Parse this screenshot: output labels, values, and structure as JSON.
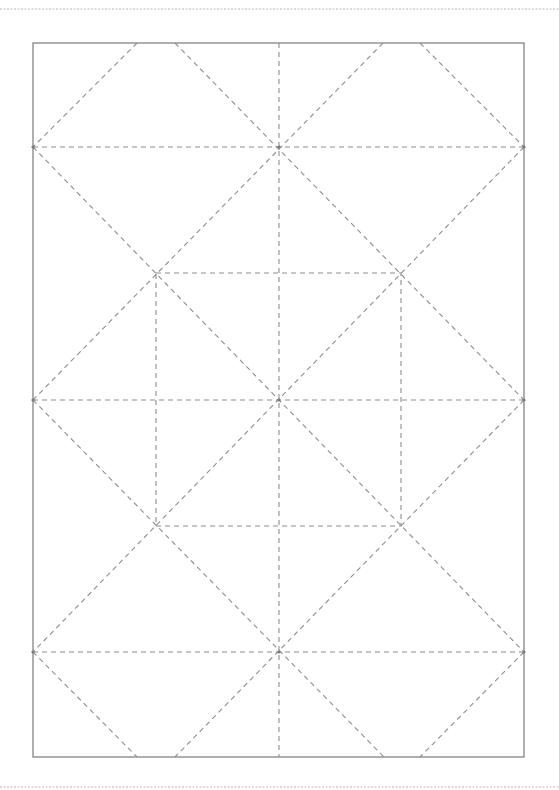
{
  "diagram": {
    "type": "crease-pattern",
    "canvas": {
      "width": 559,
      "height": 790
    },
    "colors": {
      "background": "#ffffff",
      "frame": "#7a7a7a",
      "crease": "#8e8e8e",
      "page_edge": "#b8b8b8"
    },
    "page_edges": [
      {
        "x1": 0,
        "y1": 9,
        "x2": 559,
        "y2": 9
      },
      {
        "x1": 0,
        "y1": 787,
        "x2": 559,
        "y2": 787
      }
    ],
    "frame": {
      "x": 33,
      "y": 43,
      "width": 491,
      "height": 714
    },
    "horizontal_creases": [
      147,
      400,
      652
    ],
    "vertical_creases": [
      279
    ],
    "inner_square": {
      "x": 156,
      "y": 273,
      "width": 245,
      "height": 253
    },
    "diagonal_creases": [
      {
        "x1": 33,
        "y1": 147,
        "x2": 524,
        "y2": 652
      },
      {
        "x1": 33,
        "y1": 400,
        "x2": 384,
        "y2": 757
      },
      {
        "x1": 175,
        "y1": 43,
        "x2": 524,
        "y2": 400
      },
      {
        "x1": 33,
        "y1": 652,
        "x2": 137,
        "y2": 757
      },
      {
        "x1": 420,
        "y1": 43,
        "x2": 524,
        "y2": 147
      },
      {
        "x1": 524,
        "y1": 147,
        "x2": 33,
        "y2": 652
      },
      {
        "x1": 524,
        "y1": 400,
        "x2": 175,
        "y2": 757
      },
      {
        "x1": 383,
        "y1": 43,
        "x2": 33,
        "y2": 400
      },
      {
        "x1": 524,
        "y1": 652,
        "x2": 420,
        "y2": 757
      },
      {
        "x1": 137,
        "y1": 43,
        "x2": 33,
        "y2": 147
      }
    ],
    "reference_points": [
      {
        "x": 33,
        "y": 147
      },
      {
        "x": 33,
        "y": 400
      },
      {
        "x": 33,
        "y": 652
      },
      {
        "x": 524,
        "y": 147
      },
      {
        "x": 524,
        "y": 400
      },
      {
        "x": 524,
        "y": 652
      },
      {
        "x": 279,
        "y": 147
      },
      {
        "x": 279,
        "y": 400
      },
      {
        "x": 279,
        "y": 652
      }
    ]
  }
}
